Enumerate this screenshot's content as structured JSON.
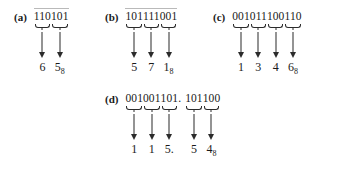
{
  "figure": {
    "ink_color": "#2b2b2b",
    "background_color": "#ffffff",
    "arrow_glyph": "down-arrow",
    "brace_glyph": "under-brace"
  },
  "items": [
    {
      "label": "(a)",
      "has_overline": true,
      "binary": "110101",
      "groups": [
        "110",
        "101"
      ],
      "separators": [],
      "octal_digits": [
        "6",
        "5"
      ],
      "subscript": "8",
      "octal": "65",
      "left": 14,
      "top": 10
    },
    {
      "label": "(b)",
      "has_overline": true,
      "binary": "101111001",
      "groups": [
        "101",
        "111",
        "001"
      ],
      "separators": [],
      "octal_digits": [
        "5",
        "7",
        "1"
      ],
      "subscript": "8",
      "octal": "571",
      "left": 105,
      "top": 10
    },
    {
      "label": "(c)",
      "has_overline": false,
      "binary": "001011100110",
      "groups": [
        "001",
        "011",
        "100",
        "110"
      ],
      "separators": [],
      "octal_digits": [
        "1",
        "3",
        "4",
        "6"
      ],
      "subscript": "8",
      "octal": "1346",
      "left": 213,
      "top": 10
    },
    {
      "label": "(d)",
      "has_overline": false,
      "binary": "001001101.101100",
      "groups": [
        "001",
        "001",
        "101",
        "101",
        "100"
      ],
      "separators": [
        null,
        null,
        ".",
        null
      ],
      "octal_digits": [
        "1",
        "1",
        "5.",
        "5",
        "4"
      ],
      "subscript": "8",
      "octal": "115.54",
      "left": 105,
      "top": 92
    }
  ]
}
